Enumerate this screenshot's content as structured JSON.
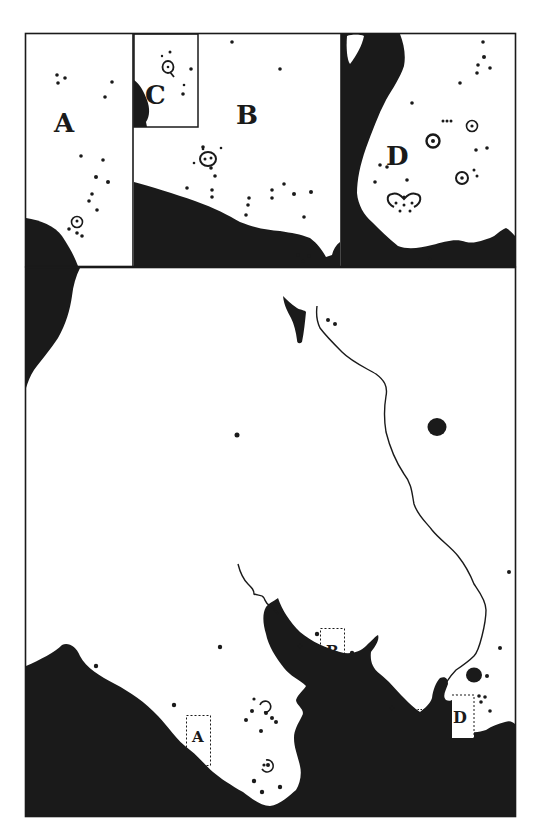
{
  "figure": {
    "type": "archaeological site distribution map with inset panels",
    "colors": {
      "ink": "#1a1a1a",
      "paper": "#ffffff"
    }
  },
  "insets": [
    {
      "id": "A",
      "label": "A",
      "position": "top-left panel"
    },
    {
      "id": "B",
      "label": "B",
      "position": "top-center panel"
    },
    {
      "id": "C",
      "label": "C",
      "position": "small panel nested in top-left of B"
    },
    {
      "id": "D",
      "label": "D",
      "position": "top-right panel"
    }
  ],
  "main_map": {
    "inset_markers": [
      {
        "id": "A",
        "label": "A",
        "style": "dashed box"
      },
      {
        "id": "B",
        "label": "B",
        "style": "dashed box"
      },
      {
        "id": "C",
        "label": "c",
        "style": "dashed box"
      },
      {
        "id": "D",
        "label": "D",
        "style": "dashed box"
      }
    ],
    "legend_symbols": [
      {
        "name": "site-dot",
        "description": "filled dot = site"
      },
      {
        "name": "ringed-site",
        "description": "dot with surrounding ring = enclosed site"
      },
      {
        "name": "land-mass",
        "description": "solid black = land / coast"
      },
      {
        "name": "river",
        "description": "thin line = river"
      }
    ]
  }
}
